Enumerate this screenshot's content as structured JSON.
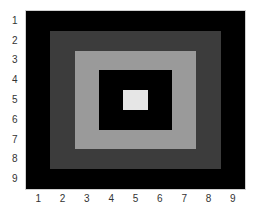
{
  "chart_data": {
    "type": "heatmap",
    "title": "",
    "xlabel": "",
    "ylabel": "",
    "x_ticks": [
      "1",
      "2",
      "3",
      "4",
      "5",
      "6",
      "7",
      "8",
      "9"
    ],
    "y_ticks": [
      "1",
      "2",
      "3",
      "4",
      "5",
      "6",
      "7",
      "8",
      "9"
    ],
    "colormap": "gray",
    "grid": false,
    "values": [
      [
        0,
        0,
        0,
        0,
        0,
        0,
        0,
        0,
        0
      ],
      [
        0,
        0.25,
        0.25,
        0.25,
        0.25,
        0.25,
        0.25,
        0.25,
        0
      ],
      [
        0,
        0.25,
        0.6,
        0.6,
        0.6,
        0.6,
        0.6,
        0.25,
        0
      ],
      [
        0,
        0.25,
        0.6,
        0,
        0,
        0,
        0.6,
        0.25,
        0
      ],
      [
        0,
        0.25,
        0.6,
        0,
        0.9,
        0,
        0.6,
        0.25,
        0
      ],
      [
        0,
        0.25,
        0.6,
        0,
        0,
        0,
        0.6,
        0.25,
        0
      ],
      [
        0,
        0.25,
        0.6,
        0.6,
        0.6,
        0.6,
        0.6,
        0.25,
        0
      ],
      [
        0,
        0.25,
        0.25,
        0.25,
        0.25,
        0.25,
        0.25,
        0.25,
        0
      ],
      [
        0,
        0,
        0,
        0,
        0,
        0,
        0,
        0,
        0
      ]
    ],
    "level_colors": {
      "0": "#000000",
      "0.25": "#3c3c3c",
      "0.6": "#9a9a9a",
      "0.9": "#e6e6e6"
    }
  }
}
